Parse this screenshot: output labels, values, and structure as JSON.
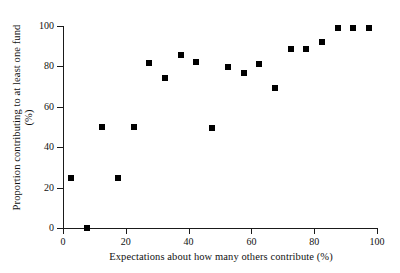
{
  "chart_data": {
    "type": "scatter",
    "title": "",
    "xlabel": "Expectations about how many others contribute (%)",
    "ylabel_line1": "Proportion contributing to at least one fund",
    "ylabel_line2": "(%)",
    "ylabel": "Proportion contributing to at least one fund (%)",
    "xlim": [
      0,
      100
    ],
    "ylim": [
      0,
      100
    ],
    "xticks": [
      0,
      20,
      40,
      60,
      80,
      100
    ],
    "yticks": [
      0,
      20,
      40,
      60,
      80,
      100
    ],
    "xtick_labels": [
      "0",
      "20",
      "40",
      "60",
      "80",
      "100"
    ],
    "ytick_labels": [
      "0",
      "20",
      "40",
      "60",
      "80",
      "100"
    ],
    "grid": false,
    "legend": null,
    "marker": "square",
    "marker_color": "#000000",
    "points": [
      {
        "x": 2.5,
        "y": 25.0
      },
      {
        "x": 7.5,
        "y": 0.0
      },
      {
        "x": 12.5,
        "y": 50.0
      },
      {
        "x": 17.5,
        "y": 25.0
      },
      {
        "x": 22.5,
        "y": 50.0
      },
      {
        "x": 27.5,
        "y": 81.5
      },
      {
        "x": 32.5,
        "y": 74.5
      },
      {
        "x": 37.5,
        "y": 85.5
      },
      {
        "x": 42.5,
        "y": 82.0
      },
      {
        "x": 47.5,
        "y": 49.5
      },
      {
        "x": 52.5,
        "y": 79.5
      },
      {
        "x": 57.5,
        "y": 76.5
      },
      {
        "x": 62.5,
        "y": 81.0
      },
      {
        "x": 67.5,
        "y": 69.5
      },
      {
        "x": 72.5,
        "y": 88.5
      },
      {
        "x": 77.5,
        "y": 88.5
      },
      {
        "x": 82.5,
        "y": 92.0
      },
      {
        "x": 87.5,
        "y": 99.0
      },
      {
        "x": 92.5,
        "y": 99.0
      },
      {
        "x": 97.5,
        "y": 99.0
      }
    ]
  }
}
